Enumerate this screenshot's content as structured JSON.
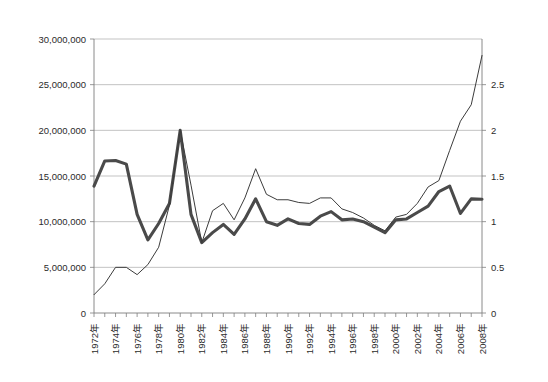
{
  "chart_data": {
    "type": "line",
    "title": "",
    "subtitle": "",
    "xlabel": "",
    "ylabel": "",
    "grid": true,
    "legend_position": "none",
    "x": [
      1972,
      1973,
      1974,
      1975,
      1976,
      1977,
      1978,
      1979,
      1980,
      1981,
      1982,
      1983,
      1984,
      1985,
      1986,
      1987,
      1988,
      1989,
      1990,
      1991,
      1992,
      1993,
      1994,
      1995,
      1996,
      1997,
      1998,
      1999,
      2000,
      2001,
      2002,
      2003,
      2004,
      2005,
      2006,
      2007,
      2008
    ],
    "xtick_labels": [
      "1972年",
      "1973年",
      "1974年",
      "1975年",
      "1976年",
      "1977年",
      "1978年",
      "1979年",
      "1980年",
      "1981年",
      "1982年",
      "1983年",
      "1984年",
      "1985年",
      "1986年",
      "1987年",
      "1988年",
      "1989年",
      "1990年",
      "1991年",
      "1992年",
      "1993年",
      "1994年",
      "1995年",
      "1996年",
      "1997年",
      "1998年",
      "1999年",
      "2000年",
      "2001年",
      "2002年",
      "2003年",
      "2004年",
      "2005年",
      "2006年",
      "2007年",
      "2008年"
    ],
    "xtick_labels_shown": [
      "1972年",
      "1974年",
      "1976年",
      "1978年",
      "1980年",
      "1982年",
      "1984年",
      "1986年",
      "1988年",
      "1990年",
      "1992年",
      "1994年",
      "1996年",
      "1998年",
      "2000年",
      "2002年",
      "2004年",
      "2006年",
      "2008年"
    ],
    "xtick_label_every": 2,
    "xtick_label_rotation": -90,
    "ylim_left": [
      0,
      30000000
    ],
    "ytick_labels_left": [
      "0",
      "5,000,000",
      "10,000,000",
      "15,000,000",
      "20,000,000",
      "25,000,000",
      "30,000,000"
    ],
    "ytick_values_left": [
      0,
      5000000,
      10000000,
      15000000,
      20000000,
      25000000,
      30000000
    ],
    "ylim_right": [
      0,
      3
    ],
    "ytick_labels_right": [
      "0",
      "0.5",
      "1",
      "1.5",
      "2",
      "2.5"
    ],
    "ytick_values_right": [
      0,
      0.5,
      1,
      1.5,
      2,
      2.5
    ],
    "series": [
      {
        "name": "series-thick",
        "axis": "left",
        "line_width": "thick",
        "color": "#4a4a4a",
        "values": [
          13900000,
          16650000,
          16700000,
          16300000,
          10800000,
          8000000,
          9800000,
          12000000,
          20000000,
          10800000,
          7700000,
          8800000,
          9700000,
          8600000,
          10300000,
          12500000,
          10000000,
          9600000,
          10300000,
          9800000,
          9700000,
          10600000,
          11100000,
          10200000,
          10300000,
          10000000,
          9400000,
          8800000,
          10200000,
          10300000,
          11000000,
          11700000,
          13300000,
          13900000,
          10900000,
          12500000,
          12450000
        ]
      },
      {
        "name": "series-thin",
        "axis": "right",
        "line_width": "thin",
        "color": "#3c3c3c",
        "values": [
          0.2,
          0.32,
          0.5,
          0.5,
          0.42,
          0.53,
          0.72,
          1.18,
          2.0,
          1.4,
          0.77,
          1.12,
          1.2,
          1.02,
          1.26,
          1.58,
          1.3,
          1.24,
          1.24,
          1.21,
          1.2,
          1.26,
          1.26,
          1.14,
          1.1,
          1.04,
          0.96,
          0.9,
          1.05,
          1.08,
          1.2,
          1.38,
          1.45,
          1.78,
          2.1,
          2.28,
          2.82
        ]
      }
    ]
  }
}
